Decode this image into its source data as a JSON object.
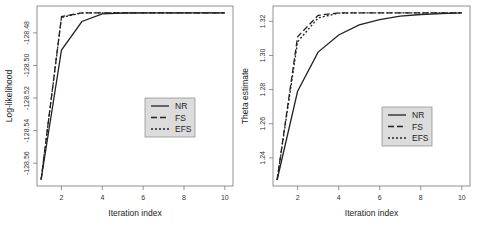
{
  "chart_data": [
    {
      "type": "line",
      "title": "",
      "xlabel": "Iteration index",
      "ylabel": "Log-likelihood",
      "x": [
        1,
        2,
        3,
        4,
        5,
        6,
        7,
        8,
        9,
        10
      ],
      "xticks": [
        "2",
        "4",
        "6",
        "8",
        "10"
      ],
      "xlim": [
        0.8,
        10.4
      ],
      "yticks": [
        "-128.48",
        "-128.50",
        "-128.52",
        "-128.54",
        "-128.56"
      ],
      "ylim": [
        -128.574,
        -128.4635
      ],
      "grid": false,
      "legend_position": "center-right",
      "series": [
        {
          "name": "NR",
          "style": "solid",
          "values": [
            -128.57,
            -128.4905,
            -128.473,
            -128.4683,
            -128.4678,
            -128.4677,
            -128.4677,
            -128.4677,
            -128.4677,
            -128.4677
          ]
        },
        {
          "name": "FS",
          "style": "dashed",
          "values": [
            -128.57,
            -128.47,
            -128.4677,
            -128.4677,
            -128.4677,
            -128.4677,
            -128.4677,
            -128.4677,
            -128.4677,
            -128.4677
          ]
        },
        {
          "name": "EFS",
          "style": "dotted",
          "values": [
            -128.57,
            -128.4705,
            -128.4678,
            -128.4677,
            -128.4677,
            -128.4677,
            -128.4677,
            -128.4677,
            -128.4677,
            -128.4677
          ]
        }
      ]
    },
    {
      "type": "line",
      "title": "",
      "xlabel": "Iteration index",
      "ylabel": "Theta estimate",
      "x": [
        1,
        2,
        3,
        4,
        5,
        6,
        7,
        8,
        9,
        10
      ],
      "xticks": [
        "2",
        "4",
        "6",
        "8",
        "10"
      ],
      "xlim": [
        0.8,
        10.4
      ],
      "yticks": [
        "1.32",
        "1.30",
        "1.28",
        "1.26",
        "1.24"
      ],
      "ylim": [
        1.2235,
        1.329
      ],
      "grid": false,
      "legend_position": "center-right",
      "series": [
        {
          "name": "NR",
          "style": "solid",
          "values": [
            1.227,
            1.279,
            1.302,
            1.312,
            1.318,
            1.321,
            1.323,
            1.324,
            1.3245,
            1.325
          ]
        },
        {
          "name": "FS",
          "style": "dashed",
          "values": [
            1.227,
            1.311,
            1.3235,
            1.325,
            1.325,
            1.325,
            1.325,
            1.325,
            1.325,
            1.325
          ]
        },
        {
          "name": "EFS",
          "style": "dotted",
          "values": [
            1.227,
            1.308,
            1.322,
            1.3248,
            1.325,
            1.325,
            1.325,
            1.325,
            1.325,
            1.325
          ]
        }
      ]
    }
  ],
  "colors": {
    "line": "#222222",
    "legend_bg": "#dcdcdc",
    "axis": "#555555"
  }
}
